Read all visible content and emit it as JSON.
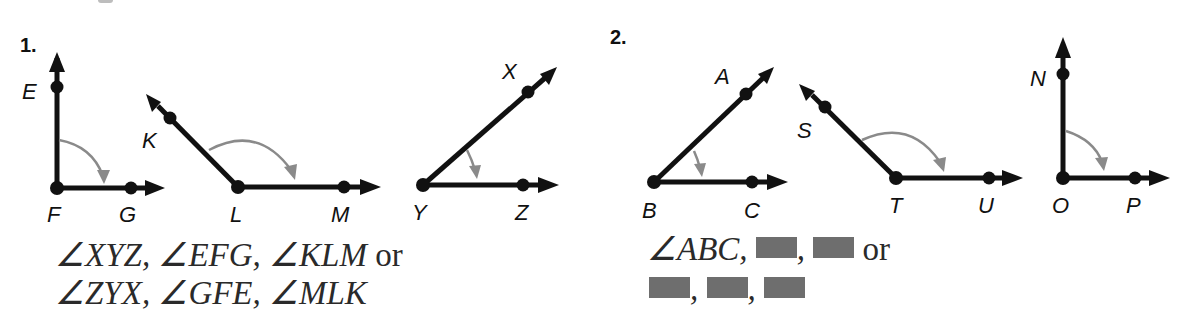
{
  "exercises": [
    {
      "number": "1.",
      "angles": [
        {
          "name": "EFG",
          "vertex": {
            "label": "F",
            "x": 57,
            "y": 188
          },
          "ray1": {
            "label": "E",
            "point": [
              57,
              87
            ],
            "tip": [
              57,
              52
            ]
          },
          "ray2": {
            "label": "G",
            "point": [
              131,
              188
            ],
            "tip": [
              165,
              188
            ]
          }
        },
        {
          "name": "KLM",
          "vertex": {
            "label": "L",
            "x": 238,
            "y": 187
          },
          "ray1": {
            "label": "K",
            "point": [
              170,
              118
            ],
            "tip": [
              147,
              95
            ]
          },
          "ray2": {
            "label": "M",
            "point": [
              344,
              187
            ],
            "tip": [
              380,
              187
            ]
          }
        },
        {
          "name": "XYZ",
          "vertex": {
            "label": "Y",
            "x": 423,
            "y": 185
          },
          "ray1": {
            "label": "X",
            "point": [
              528,
              92
            ],
            "tip": [
              556,
              68
            ]
          },
          "ray2": {
            "label": "Z",
            "point": [
              523,
              185
            ],
            "tip": [
              558,
              185
            ]
          }
        }
      ],
      "answer": {
        "line1": [
          {
            "text": "∠XYZ",
            "italic": true
          },
          {
            "text": ", ",
            "italic": true
          },
          {
            "text": "∠EFG",
            "italic": true
          },
          {
            "text": ", ",
            "italic": true
          },
          {
            "text": "∠KLM",
            "italic": true
          },
          {
            "text": " or",
            "italic": false
          }
        ],
        "line2": [
          {
            "text": "∠ZYX",
            "italic": true
          },
          {
            "text": ", ",
            "italic": true
          },
          {
            "text": "∠GFE",
            "italic": true
          },
          {
            "text": ", ",
            "italic": true
          },
          {
            "text": "∠MLK",
            "italic": true
          }
        ]
      }
    },
    {
      "number": "2.",
      "angles": [
        {
          "name": "ABC",
          "vertex": {
            "label": "B",
            "x": 654,
            "y": 182
          },
          "ray1": {
            "label": "A",
            "point": [
              746,
              94
            ],
            "tip": [
              773,
              68
            ]
          },
          "ray2": {
            "label": "C",
            "point": [
              752,
              182
            ],
            "tip": [
              788,
              182
            ]
          }
        },
        {
          "name": "STU",
          "vertex": {
            "label": "T",
            "x": 896,
            "y": 178
          },
          "ray1": {
            "label": "S",
            "point": [
              825,
              107
            ],
            "tip": [
              800,
              84
            ]
          },
          "ray2": {
            "label": "U",
            "point": [
              989,
              178
            ],
            "tip": [
              1023,
              178
            ]
          }
        },
        {
          "name": "NOP",
          "vertex": {
            "label": "O",
            "x": 1063,
            "y": 178
          },
          "ray1": {
            "label": "N",
            "point": [
              1063,
              74
            ],
            "tip": [
              1063,
              38
            ]
          },
          "ray2": {
            "label": "P",
            "point": [
              1135,
              178
            ],
            "tip": [
              1170,
              178
            ]
          }
        }
      ],
      "answer": {
        "line1_text": "∠ABC,",
        "line1_sep": ",",
        "or_text": "or",
        "line2_sep": ",",
        "blank_count_line1": 2,
        "blank_count_line2": 3
      }
    }
  ],
  "colors": {
    "ray": "#111111",
    "arc": "#8a8a8a",
    "text": "#2a2a2a",
    "blank": "#6e6e6e"
  }
}
